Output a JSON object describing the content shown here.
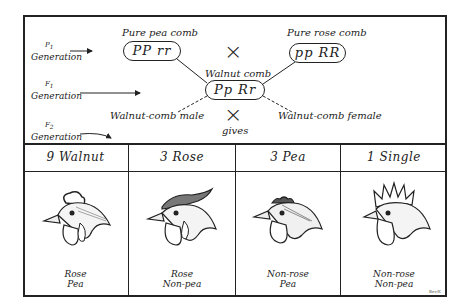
{
  "generations": [
    {
      "label": "P",
      "sub": "1",
      "text": "Generation"
    },
    {
      "label": "F",
      "sub": "1",
      "text": "Generation"
    },
    {
      "label": "F",
      "sub": "2",
      "text": "Generation"
    }
  ],
  "parents": {
    "left": {
      "title": "Pure pea comb",
      "genotype": "PP rr"
    },
    "right": {
      "title": "Pure rose comb",
      "genotype": "pp RR"
    }
  },
  "f1": {
    "title": "Walnut comb",
    "genotype": "Pp Rr"
  },
  "f1_cross": {
    "male": "Walnut-comb male",
    "female": "Walnut-comb female",
    "gives": "gives"
  },
  "cross_symbol": "×",
  "table": {
    "columns": [
      {
        "header": "9 Walnut",
        "line1": "Rose",
        "line2": "Pea",
        "comb": "walnut"
      },
      {
        "header": "3 Rose",
        "line1": "Rose",
        "line2": "Non-pea",
        "comb": "rose"
      },
      {
        "header": "3 Pea",
        "line1": "Non-rose",
        "line2": "Pea",
        "comb": "pea"
      },
      {
        "header": "1 Single",
        "line1": "Non-rose",
        "line2": "Non-pea",
        "comb": "single"
      }
    ]
  },
  "signature": "Bev/K"
}
